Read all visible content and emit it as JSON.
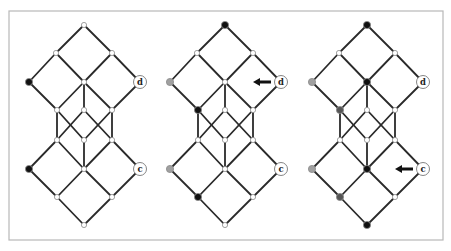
{
  "figure": {
    "width": 451,
    "height": 251,
    "frame": {
      "x": 9,
      "y": 11,
      "width": 434,
      "height": 229
    },
    "colors": {
      "white": "#ffffff",
      "black": "#111111",
      "gray": "#a0a0a0",
      "dark_gray": "#555555",
      "edge": "#2a2a2a"
    },
    "lattice": {
      "nodes": [
        {
          "id": "top",
          "dx": 0,
          "y": 25
        },
        {
          "id": "l2a",
          "dx": -28,
          "y": 53
        },
        {
          "id": "l2b",
          "dx": 28,
          "y": 53
        },
        {
          "id": "l3a",
          "dx": -55,
          "y": 82
        },
        {
          "id": "l3b",
          "dx": 0,
          "y": 82
        },
        {
          "id": "d",
          "dx": 56,
          "y": 82
        },
        {
          "id": "l4a",
          "dx": -27,
          "y": 110
        },
        {
          "id": "l4b",
          "dx": 0,
          "y": 110
        },
        {
          "id": "l4c",
          "dx": 28,
          "y": 110
        },
        {
          "id": "l5a",
          "dx": -27,
          "y": 140
        },
        {
          "id": "l5b",
          "dx": 0,
          "y": 140
        },
        {
          "id": "l5c",
          "dx": 28,
          "y": 140
        },
        {
          "id": "l6a",
          "dx": -55,
          "y": 169
        },
        {
          "id": "l6b",
          "dx": 0,
          "y": 169
        },
        {
          "id": "c",
          "dx": 56,
          "y": 169
        },
        {
          "id": "l7a",
          "dx": -27,
          "y": 197
        },
        {
          "id": "l7b",
          "dx": 28,
          "y": 197
        },
        {
          "id": "bottom",
          "dx": 0,
          "y": 225
        }
      ],
      "edges": [
        [
          "top",
          "l2a"
        ],
        [
          "top",
          "l2b"
        ],
        [
          "l2a",
          "l3a"
        ],
        [
          "l2a",
          "l3b"
        ],
        [
          "l2b",
          "l3b"
        ],
        [
          "l2b",
          "d"
        ],
        [
          "l3a",
          "l4a"
        ],
        [
          "l3b",
          "l4a"
        ],
        [
          "l3b",
          "l4b"
        ],
        [
          "l3b",
          "l4c"
        ],
        [
          "d",
          "l4c"
        ],
        [
          "l4a",
          "l5a"
        ],
        [
          "l4c",
          "l5c"
        ],
        [
          "l4a",
          "l5b"
        ],
        [
          "l4b",
          "l5a"
        ],
        [
          "l4b",
          "l5c"
        ],
        [
          "l4c",
          "l5b"
        ],
        [
          "l5a",
          "l6a"
        ],
        [
          "l5a",
          "l6b"
        ],
        [
          "l5b",
          "l6b"
        ],
        [
          "l5c",
          "l6b"
        ],
        [
          "l5c",
          "c"
        ],
        [
          "l6a",
          "l7a"
        ],
        [
          "l6b",
          "l7a"
        ],
        [
          "l6b",
          "l7b"
        ],
        [
          "c",
          "l7b"
        ],
        [
          "l7a",
          "bottom"
        ],
        [
          "l7b",
          "bottom"
        ]
      ],
      "labels": {
        "d": "d",
        "c": "c"
      }
    },
    "panels": [
      {
        "name": "panel-1",
        "cx": 84,
        "node_fills": {
          "l3a": "black",
          "l6a": "black"
        },
        "arrow": null
      },
      {
        "name": "panel-2",
        "cx": 225,
        "node_fills": {
          "top": "black",
          "l3a": "gray",
          "l4a": "black",
          "l6a": "gray",
          "l7a": "black"
        },
        "arrow": {
          "target": "d",
          "direction": "left"
        }
      },
      {
        "name": "panel-3",
        "cx": 367,
        "node_fills": {
          "top": "black",
          "l3a": "gray",
          "l3b": "black",
          "l4a": "dark_gray",
          "l6a": "gray",
          "l6b": "black",
          "l7a": "dark_gray",
          "bottom": "black"
        },
        "arrow": {
          "target": "c",
          "direction": "left"
        }
      }
    ]
  }
}
